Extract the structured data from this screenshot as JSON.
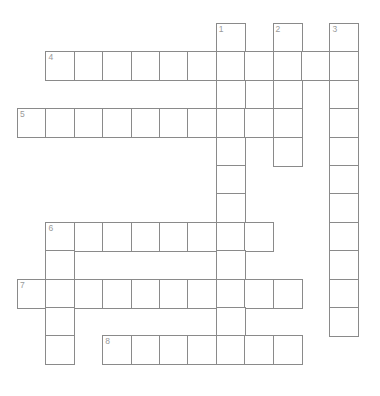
{
  "puzzle": {
    "type": "crossword-grid",
    "title": "Crossword puzzle grid",
    "geometry": {
      "cell_size": 28.4,
      "origin_x": 17,
      "origin_y": 23,
      "border_color": "#8a8a8a",
      "cell_fill": "#ffffff",
      "number_color": "#9a9a9a",
      "canvas_width": 380,
      "canvas_height": 396
    },
    "clue_numbers": [
      {
        "label": "1",
        "col": 7,
        "row": 0
      },
      {
        "label": "2",
        "col": 9,
        "row": 0
      },
      {
        "label": "3",
        "col": 11,
        "row": 0
      },
      {
        "label": "4",
        "col": 1,
        "row": 1
      },
      {
        "label": "5",
        "col": 0,
        "row": 3
      },
      {
        "label": "6",
        "col": 1,
        "row": 7
      },
      {
        "label": "7",
        "col": 0,
        "row": 9
      },
      {
        "label": "8",
        "col": 3,
        "row": 11
      }
    ],
    "entries": [
      {
        "number": "1",
        "direction": "down",
        "col": 7,
        "row": 0,
        "length": 12
      },
      {
        "number": "2",
        "direction": "down",
        "col": 9,
        "row": 0,
        "length": 5
      },
      {
        "number": "3",
        "direction": "down",
        "col": 11,
        "row": 0,
        "length": 11
      },
      {
        "number": "4",
        "direction": "across",
        "col": 1,
        "row": 1,
        "length": 11
      },
      {
        "number": "5",
        "direction": "across",
        "col": 0,
        "row": 3,
        "length": 10
      },
      {
        "number": "6",
        "direction": "across",
        "col": 1,
        "row": 7,
        "length": 9
      },
      {
        "number": "6",
        "direction": "down",
        "col": 1,
        "row": 7,
        "length": 5
      },
      {
        "number": "7",
        "direction": "across",
        "col": 0,
        "row": 9,
        "length": 10
      },
      {
        "number": "8",
        "direction": "across",
        "col": 3,
        "row": 11,
        "length": 7
      }
    ],
    "cells": [
      {
        "col": 7,
        "row": 0,
        "num": "1"
      },
      {
        "col": 9,
        "row": 0,
        "num": "2"
      },
      {
        "col": 11,
        "row": 0,
        "num": "3"
      },
      {
        "col": 1,
        "row": 1,
        "num": "4"
      },
      {
        "col": 2,
        "row": 1,
        "num": ""
      },
      {
        "col": 3,
        "row": 1,
        "num": ""
      },
      {
        "col": 4,
        "row": 1,
        "num": ""
      },
      {
        "col": 5,
        "row": 1,
        "num": ""
      },
      {
        "col": 6,
        "row": 1,
        "num": ""
      },
      {
        "col": 7,
        "row": 1,
        "num": ""
      },
      {
        "col": 8,
        "row": 1,
        "num": ""
      },
      {
        "col": 9,
        "row": 1,
        "num": ""
      },
      {
        "col": 10,
        "row": 1,
        "num": ""
      },
      {
        "col": 11,
        "row": 1,
        "num": ""
      },
      {
        "col": 7,
        "row": 2,
        "num": ""
      },
      {
        "col": 9,
        "row": 2,
        "num": ""
      },
      {
        "col": 11,
        "row": 2,
        "num": ""
      },
      {
        "col": 0,
        "row": 3,
        "num": "5"
      },
      {
        "col": 1,
        "row": 3,
        "num": ""
      },
      {
        "col": 2,
        "row": 3,
        "num": ""
      },
      {
        "col": 3,
        "row": 3,
        "num": ""
      },
      {
        "col": 4,
        "row": 3,
        "num": ""
      },
      {
        "col": 5,
        "row": 3,
        "num": ""
      },
      {
        "col": 6,
        "row": 3,
        "num": ""
      },
      {
        "col": 7,
        "row": 3,
        "num": ""
      },
      {
        "col": 8,
        "row": 3,
        "num": ""
      },
      {
        "col": 9,
        "row": 3,
        "num": ""
      },
      {
        "col": 11,
        "row": 3,
        "num": ""
      },
      {
        "col": 7,
        "row": 4,
        "num": ""
      },
      {
        "col": 9,
        "row": 4,
        "num": ""
      },
      {
        "col": 11,
        "row": 4,
        "num": ""
      },
      {
        "col": 7,
        "row": 5,
        "num": ""
      },
      {
        "col": 11,
        "row": 5,
        "num": ""
      },
      {
        "col": 7,
        "row": 6,
        "num": ""
      },
      {
        "col": 11,
        "row": 6,
        "num": ""
      },
      {
        "col": 1,
        "row": 7,
        "num": "6"
      },
      {
        "col": 2,
        "row": 7,
        "num": ""
      },
      {
        "col": 3,
        "row": 7,
        "num": ""
      },
      {
        "col": 4,
        "row": 7,
        "num": ""
      },
      {
        "col": 5,
        "row": 7,
        "num": ""
      },
      {
        "col": 6,
        "row": 7,
        "num": ""
      },
      {
        "col": 7,
        "row": 7,
        "num": ""
      },
      {
        "col": 8,
        "row": 7,
        "num": ""
      },
      {
        "col": 11,
        "row": 7,
        "num": ""
      },
      {
        "col": 1,
        "row": 8,
        "num": ""
      },
      {
        "col": 7,
        "row": 8,
        "num": ""
      },
      {
        "col": 11,
        "row": 8,
        "num": ""
      },
      {
        "col": 0,
        "row": 9,
        "num": "7"
      },
      {
        "col": 1,
        "row": 9,
        "num": ""
      },
      {
        "col": 2,
        "row": 9,
        "num": ""
      },
      {
        "col": 3,
        "row": 9,
        "num": ""
      },
      {
        "col": 4,
        "row": 9,
        "num": ""
      },
      {
        "col": 5,
        "row": 9,
        "num": ""
      },
      {
        "col": 6,
        "row": 9,
        "num": ""
      },
      {
        "col": 7,
        "row": 9,
        "num": ""
      },
      {
        "col": 8,
        "row": 9,
        "num": ""
      },
      {
        "col": 9,
        "row": 9,
        "num": ""
      },
      {
        "col": 11,
        "row": 9,
        "num": ""
      },
      {
        "col": 1,
        "row": 10,
        "num": ""
      },
      {
        "col": 7,
        "row": 10,
        "num": ""
      },
      {
        "col": 11,
        "row": 10,
        "num": ""
      },
      {
        "col": 1,
        "row": 11,
        "num": ""
      },
      {
        "col": 3,
        "row": 11,
        "num": "8"
      },
      {
        "col": 4,
        "row": 11,
        "num": ""
      },
      {
        "col": 5,
        "row": 11,
        "num": ""
      },
      {
        "col": 6,
        "row": 11,
        "num": ""
      },
      {
        "col": 7,
        "row": 11,
        "num": ""
      },
      {
        "col": 8,
        "row": 11,
        "num": ""
      },
      {
        "col": 9,
        "row": 11,
        "num": ""
      }
    ]
  }
}
